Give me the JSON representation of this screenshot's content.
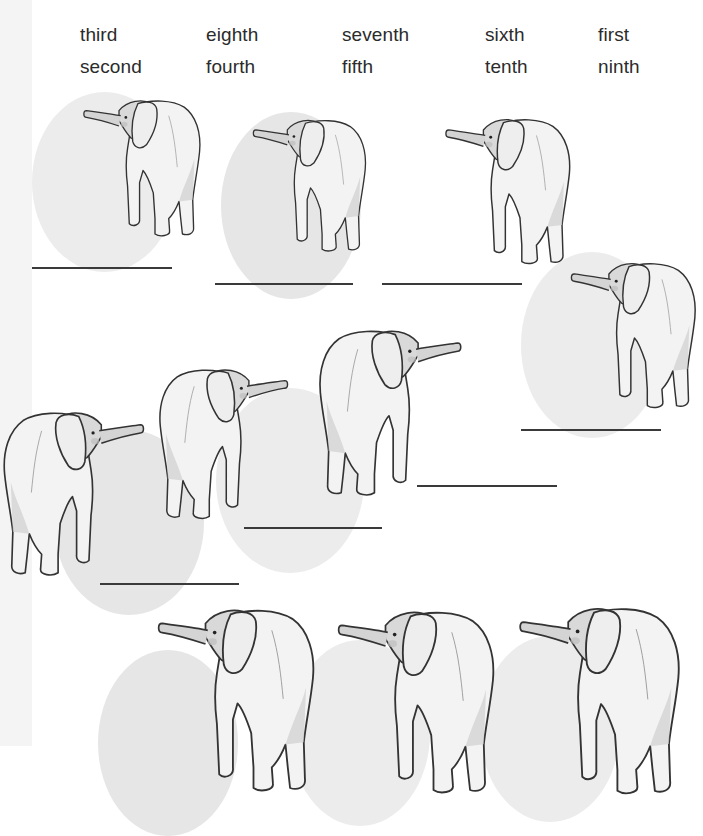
{
  "worksheet": {
    "word_bank": [
      {
        "label": "third",
        "row": 1,
        "col": 1
      },
      {
        "label": "eighth",
        "row": 1,
        "col": 2
      },
      {
        "label": "seventh",
        "row": 1,
        "col": 3
      },
      {
        "label": "sixth",
        "row": 1,
        "col": 4
      },
      {
        "label": "first",
        "row": 1,
        "col": 5
      },
      {
        "label": "second",
        "row": 2,
        "col": 1
      },
      {
        "label": "fourth",
        "row": 2,
        "col": 2
      },
      {
        "label": "fifth",
        "row": 2,
        "col": 3
      },
      {
        "label": "tenth",
        "row": 2,
        "col": 4
      },
      {
        "label": "ninth",
        "row": 2,
        "col": 5
      }
    ],
    "elephant_count": 10,
    "answer_lines": [
      {
        "value": ""
      },
      {
        "value": ""
      },
      {
        "value": ""
      },
      {
        "value": ""
      },
      {
        "value": ""
      },
      {
        "value": ""
      },
      {
        "value": ""
      }
    ],
    "colors": {
      "text": "#2b2b2b",
      "circle_fill": "#e6e6e6",
      "line": "#3a3a3a",
      "edge_strip": "#f4f4f4"
    }
  }
}
